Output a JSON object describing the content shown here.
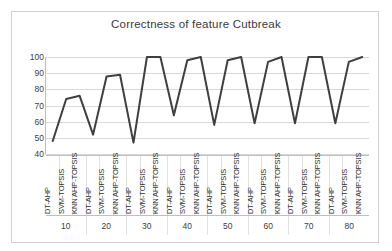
{
  "chart_data": {
    "type": "line",
    "title": "Correctness of feature Cutbreak",
    "xlabel": "",
    "ylabel": "",
    "ylim": [
      40,
      100
    ],
    "ytick_step": 10,
    "yticks": [
      100,
      90,
      80,
      70,
      60,
      50,
      40
    ],
    "grid": true,
    "legend": "none",
    "line_color": "#3f3f3f",
    "methods": [
      "DT-AHP",
      "SVM-TOPSIS",
      "KNN AHP-TOPSIS"
    ],
    "groups": [
      "10",
      "20",
      "30",
      "40",
      "50",
      "60",
      "70",
      "80"
    ],
    "categories": [
      "DT-AHP",
      "SVM-TOPSIS",
      "KNN AHP-TOPSIS",
      "DT-AHP",
      "SVM-TOPSIS",
      "KNN AHP-TOPSIS",
      "DT-AHP",
      "SVM-TOPSIS",
      "KNN AHP-TOPSIS",
      "DT-AHP",
      "SVM-TOPSIS",
      "KNN AHP-TOPSIS",
      "DT-AHP",
      "SVM-TOPSIS",
      "KNN AHP-TOPSIS",
      "DT-AHP",
      "SVM-TOPSIS",
      "KNN AHP-TOPSIS",
      "DT-AHP",
      "SVM-TOPSIS",
      "KNN AHP-TOPSIS",
      "DT-AHP",
      "SVM-TOPSIS",
      "KNN AHP-TOPSIS"
    ],
    "values": [
      48,
      74,
      76,
      52,
      88,
      89,
      47,
      100,
      100,
      64,
      98,
      100,
      58,
      98,
      100,
      59,
      97,
      100,
      59,
      100,
      100,
      59,
      97,
      100
    ]
  },
  "chart": {
    "title": "Correctness of feature Cutbreak"
  }
}
